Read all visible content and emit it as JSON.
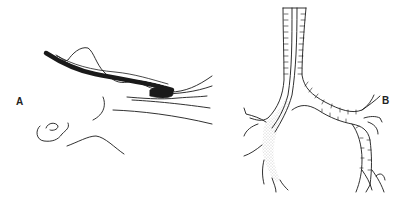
{
  "figure": {
    "panels": [
      {
        "id": "A",
        "label": "A",
        "description": "Lateral view line drawing of head/neck with bronchoscope tube inserted through mouth into airway"
      },
      {
        "id": "B",
        "label": "B",
        "description": "Line drawing of trachea and bronchial tree with tube in right main bronchus (stippled)"
      }
    ]
  },
  "colors": {
    "background": "#ffffff",
    "ink": "#1a1a1a",
    "stipple": "#9a9a9a"
  }
}
